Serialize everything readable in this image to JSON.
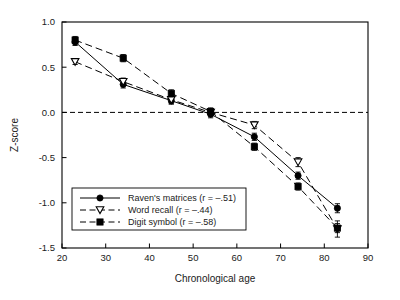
{
  "chart_data": {
    "type": "line",
    "title": "",
    "xlabel": "Chronological age",
    "ylabel": "Z-score",
    "xlim": [
      20,
      90
    ],
    "ylim": [
      -1.5,
      1.0
    ],
    "xticks": [
      20,
      30,
      40,
      50,
      60,
      70,
      80,
      90
    ],
    "xtick_labels": [
      "20",
      "30",
      "40",
      "50",
      "60",
      "70",
      "80",
      "90"
    ],
    "yticks": [
      1.0,
      0.5,
      0.0,
      -0.5,
      -1.0,
      -1.5
    ],
    "ytick_labels": [
      "1.0",
      "0.5",
      "0.0",
      "-0.5",
      "-1.0",
      "-1.5"
    ],
    "grid": false,
    "reference_line": {
      "y": 0.0,
      "style": "dashed"
    },
    "legend_position": "lower-left",
    "x": [
      23,
      34,
      45,
      54,
      64,
      74,
      83
    ],
    "series": [
      {
        "name": "Raven's matrices (r = -.51)",
        "marker": "filled-circle",
        "line_style": "solid",
        "values": [
          0.78,
          0.31,
          0.13,
          -0.02,
          -0.27,
          -0.7,
          -1.06
        ],
        "errors": [
          0.04,
          0.04,
          0.04,
          0.04,
          0.04,
          0.04,
          0.05
        ]
      },
      {
        "name": "Word recall (r = -.44)",
        "marker": "open-triangle-down",
        "line_style": "dashed",
        "values": [
          0.56,
          0.34,
          0.14,
          0.0,
          -0.14,
          -0.55,
          -1.29
        ],
        "errors": [
          0.03,
          0.04,
          0.04,
          0.04,
          0.04,
          0.05,
          0.09
        ]
      },
      {
        "name": "Digit symbol (r = -.58)",
        "marker": "filled-square",
        "line_style": "dashed",
        "values": [
          0.8,
          0.6,
          0.21,
          0.01,
          -0.38,
          -0.82,
          -1.28
        ],
        "errors": [
          0.04,
          0.04,
          0.04,
          0.04,
          0.04,
          0.04,
          0.05
        ]
      }
    ],
    "colors": {
      "ink": "#000000",
      "background": "#ffffff"
    }
  }
}
